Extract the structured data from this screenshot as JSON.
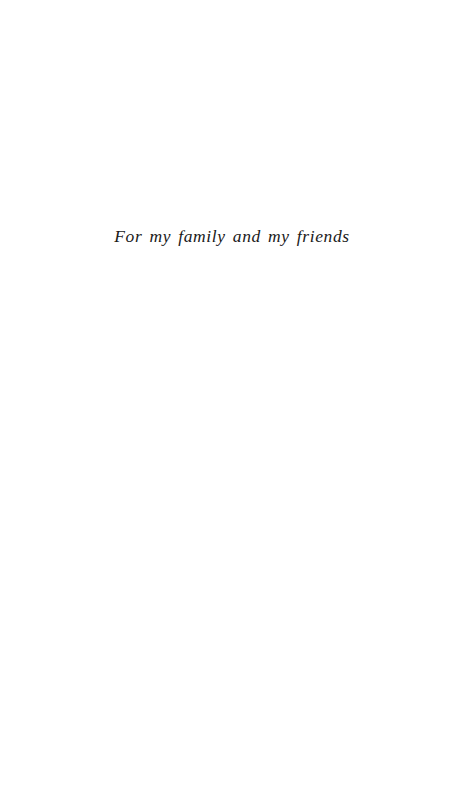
{
  "page": {
    "kind": "book-dedication-page",
    "width": 475,
    "height": 811,
    "background_color": "#ffffff",
    "text_color": "#1a1a1a"
  },
  "dedication": {
    "text": "For my family and my friends",
    "style": "italic-serif",
    "alignment": "center"
  }
}
